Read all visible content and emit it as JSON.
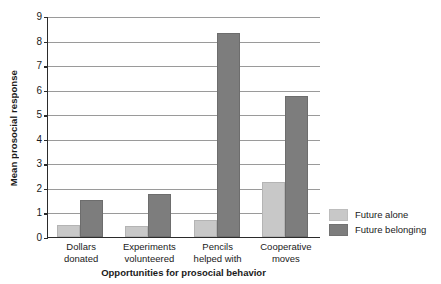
{
  "chart_data": {
    "type": "bar",
    "title": "",
    "xlabel": "Opportunities for prosocial behavior",
    "ylabel": "Mean prosocial response",
    "categories": [
      "Dollars donated",
      "Experiments volunteered",
      "Pencils helped with",
      "Cooperative moves"
    ],
    "category_lines": [
      [
        "Dollars",
        "donated"
      ],
      [
        "Experiments",
        "volunteered"
      ],
      [
        "Pencils",
        "helped with"
      ],
      [
        "Cooperative",
        "moves"
      ]
    ],
    "series": [
      {
        "name": "Future alone",
        "color": "#c8c8c8",
        "values": [
          0.5,
          0.45,
          0.7,
          2.25
        ]
      },
      {
        "name": "Future belonging",
        "color": "#7d7d7d",
        "values": [
          1.5,
          1.75,
          8.3,
          5.75
        ]
      }
    ],
    "ylim": [
      0,
      9
    ],
    "ytick_values": [
      0,
      1,
      2,
      3,
      4,
      5,
      6,
      7,
      8,
      9
    ],
    "ytick_labels": [
      "0",
      "1",
      "2",
      "3",
      "4",
      "5",
      "6",
      "7",
      "8",
      "9"
    ],
    "grid": true,
    "grid_axis": "y",
    "legend_position": "right"
  }
}
